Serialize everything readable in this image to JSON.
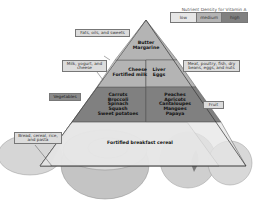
{
  "legend": {
    "title": "Nutrient Density for Vitamin A",
    "levels": [
      {
        "label": "low",
        "color": "#e6e6e6"
      },
      {
        "label": "medium",
        "color": "#b4b4b4"
      },
      {
        "label": "high",
        "color": "#808080"
      }
    ]
  },
  "groups": {
    "fats": {
      "label": "Fats, oils, and sweets",
      "foods": [
        "Butter",
        "Margarine"
      ]
    },
    "milk": {
      "label": "Milk, yogurt, and cheese",
      "foods": [
        "Cheese",
        "Fortified milk"
      ]
    },
    "meat": {
      "label": "Meat, poultry, fish, dry beans, eggs, and nuts",
      "foods": [
        "Liver",
        "Eggs"
      ]
    },
    "vegetables": {
      "label": "Vegetables",
      "foods": [
        "Carrots",
        "Broccoli",
        "Spinach",
        "Squash",
        "Sweet potatoes"
      ]
    },
    "fruit": {
      "label": "Fruit",
      "foods": [
        "Peaches",
        "Apricots",
        "Cantaloupes",
        "Mangoes",
        "Papaya"
      ]
    },
    "grains": {
      "label": "Bread, cereal, rice, and pasta",
      "foods": [
        "Fortified breakfast cereal"
      ]
    }
  }
}
